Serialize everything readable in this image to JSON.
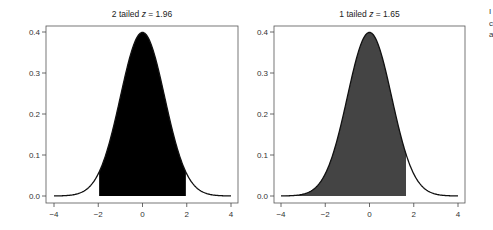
{
  "chart_data": [
    {
      "type": "area",
      "title": "2 tailed z = 1.96",
      "title_prefix": "2 tailed ",
      "title_var": "z",
      "title_suffix": " = 1.96",
      "xlabel": "",
      "ylabel": "",
      "xlim": [
        -4,
        4
      ],
      "ylim": [
        0,
        0.4
      ],
      "x_ticks": [
        "-4",
        "-2",
        "0",
        "2",
        "4"
      ],
      "y_ticks": [
        "0.0",
        "0.1",
        "0.2",
        "0.3",
        "0.4"
      ],
      "curve": "standard normal density",
      "shaded_region": [
        -1.96,
        1.96
      ],
      "fill_color": "#000000",
      "grid": false
    },
    {
      "type": "area",
      "title": "1 tailed z = 1.65",
      "title_prefix": "1 tailed ",
      "title_var": "z",
      "title_suffix": " = 1.65",
      "xlabel": "",
      "ylabel": "",
      "xlim": [
        -4,
        4
      ],
      "ylim": [
        0,
        0.4
      ],
      "x_ticks": [
        "-4",
        "-2",
        "0",
        "2",
        "4"
      ],
      "y_ticks": [
        "0.0",
        "0.1",
        "0.2",
        "0.3",
        "0.4"
      ],
      "curve": "standard normal density",
      "shaded_region": [
        -4,
        1.65
      ],
      "fill_color": "#444444",
      "grid": false
    }
  ],
  "edge_fragments": [
    "I",
    "c",
    "a"
  ]
}
